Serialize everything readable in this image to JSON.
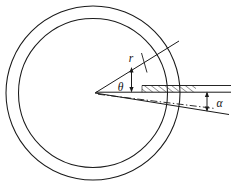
{
  "figure": {
    "background_color": "#ffffff",
    "stroke_color": "#1a1a1a",
    "hatch_color": "#2b2b2b",
    "width": 234,
    "height": 186
  },
  "labels": {
    "radius": "r",
    "theta": "θ",
    "alpha": "α"
  },
  "geometry": {
    "center": {
      "x": 93,
      "y": 93
    },
    "outer_circle_radius": 88,
    "inner_circle_radius": 75,
    "apex": {
      "x": 95,
      "y": 93
    },
    "upper_ray_end": {
      "x": 178,
      "y": 42
    },
    "lower_ray_end": {
      "x": 228,
      "y": 115
    },
    "horizontal_ray_end": {
      "x": 230,
      "y": 89
    },
    "theta_marker_x": 131,
    "alpha_marker_x": 207
  },
  "annotations": {
    "radius_label_pos": {
      "x": 133,
      "y": 60
    },
    "theta_label_pos": {
      "x": 120,
      "y": 90
    },
    "alpha_label_pos": {
      "x": 216,
      "y": 106
    }
  }
}
